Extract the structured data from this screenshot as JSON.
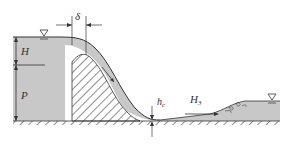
{
  "diagram": {
    "type": "hydraulic-weir-flow-profile",
    "labels": {
      "overflow_thickness": "δ",
      "head": "H",
      "weir_height": "P",
      "contracted_depth": "h",
      "contracted_depth_subscript": "c",
      "downstream_depth": "H",
      "downstream_depth_subscript": "3"
    },
    "symbols": {
      "upstream_water_surface": "water-surface-triangle",
      "downstream_water_surface": "water-surface-triangle"
    },
    "colors": {
      "water": "#c8c8c8",
      "lines": "#333333",
      "hatch": "#444444",
      "background": "#ffffff"
    }
  }
}
